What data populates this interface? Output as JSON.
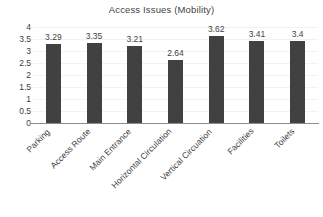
{
  "chart_data": {
    "type": "bar",
    "title": "Access Issues (Mobility)",
    "xlabel": "",
    "ylabel": "",
    "ylim": [
      0,
      4
    ],
    "grid": true,
    "legend": false,
    "bar_color": "#414141",
    "categories": [
      "Parking",
      "Access Route",
      "Main Entrance",
      "Horizontal Circulation",
      "Vertical Circuation",
      "Facilities",
      "Toilets"
    ],
    "values": [
      3.29,
      3.35,
      3.21,
      2.64,
      3.62,
      3.41,
      3.4
    ],
    "value_labels": [
      "3.29",
      "3.35",
      "3.21",
      "2.64",
      "3.62",
      "3.41",
      "3.4"
    ],
    "yticks": [
      0,
      0.5,
      1,
      1.5,
      2,
      2.5,
      3,
      3.5,
      4
    ],
    "ytick_labels": [
      "0",
      "0.5",
      "1",
      "1.5",
      "2",
      "2.5",
      "3",
      "3.5",
      "4"
    ]
  }
}
